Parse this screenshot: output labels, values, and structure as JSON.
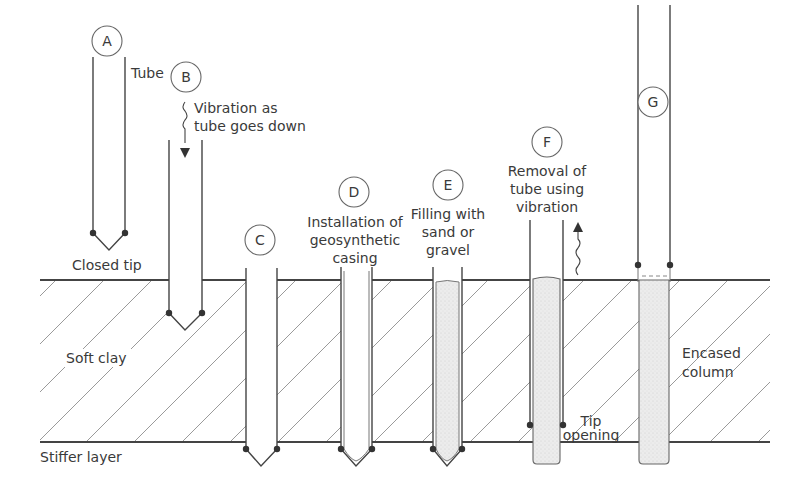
{
  "diagram": {
    "layers": {
      "soft": "Soft clay",
      "stiff": "Stiffer layer"
    },
    "stages": [
      {
        "id": "A",
        "labels": [
          "Tube"
        ],
        "caption": [
          "Closed tip"
        ]
      },
      {
        "id": "B",
        "caption": [
          "Vibration as",
          "tube goes down"
        ]
      },
      {
        "id": "C",
        "caption": []
      },
      {
        "id": "D",
        "caption": [
          "Installation of",
          "geosynthetic",
          "casing"
        ]
      },
      {
        "id": "E",
        "caption": [
          "Filling with",
          "sand or",
          "gravel"
        ]
      },
      {
        "id": "F",
        "caption": [
          "Removal of",
          "tube using",
          "vibration"
        ],
        "extra": [
          "Tip",
          "opening"
        ]
      },
      {
        "id": "G",
        "caption": [
          "Encased",
          "column"
        ]
      }
    ],
    "colors": {
      "line": "#444444",
      "hatch": "#9a9a9a",
      "fill": "#e8e8e8",
      "text": "#3a3a3a"
    }
  }
}
